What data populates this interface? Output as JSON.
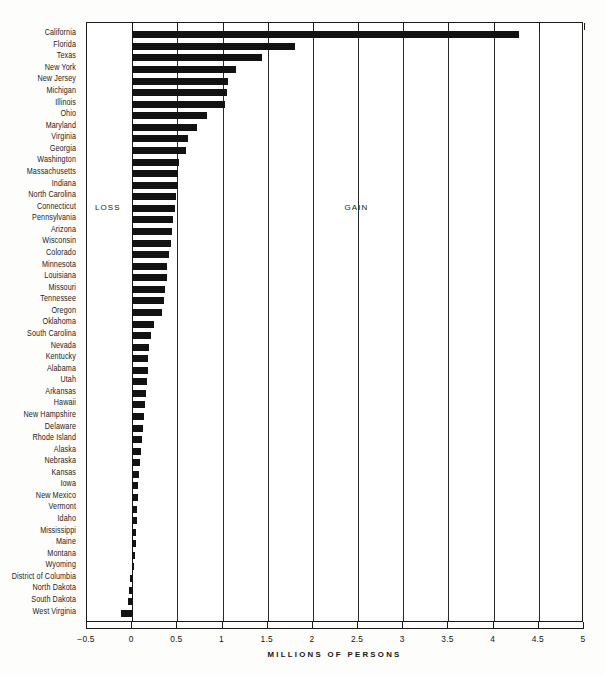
{
  "chart_data": {
    "type": "bar",
    "orientation": "horizontal",
    "title": "",
    "xlabel": "MILLIONS OF PERSONS",
    "ylabel": "",
    "xlim": [
      -0.5,
      5
    ],
    "xticks": [
      -0.5,
      0,
      0.5,
      1,
      1.5,
      2,
      2.5,
      3,
      3.5,
      4,
      4.5,
      5
    ],
    "xtick_labels": [
      "−0.5",
      "0",
      "0.5",
      "1",
      "1.5",
      "2",
      "2.5",
      "3",
      "3.5",
      "4",
      "4.5",
      "5"
    ],
    "grid": true,
    "grid_axis": "x",
    "zero_reference_line": 0,
    "legend": null,
    "annotations": [
      {
        "text": "LOSS",
        "x": -0.2,
        "y_category": "Connecticut"
      },
      {
        "text": "GAIN",
        "x": 2.35,
        "y_category": "Connecticut"
      }
    ],
    "categories": [
      "California",
      "Florida",
      "Texas",
      "New York",
      "New Jersey",
      "Michigan",
      "Illinois",
      "Ohio",
      "Maryland",
      "Virginia",
      "Georgia",
      "Washington",
      "Massachusetts",
      "Indiana",
      "North Carolina",
      "Connecticut",
      "Pennsylvania",
      "Arizona",
      "Wisconsin",
      "Colorado",
      "Minnesota",
      "Louisiana",
      "Missouri",
      "Tennessee",
      "Oregon",
      "Oklahoma",
      "South Carolina",
      "Nevada",
      "Kentucky",
      "Alabama",
      "Utah",
      "Arkansas",
      "Hawaii",
      "New Hampshire",
      "Delaware",
      "Rhode Island",
      "Alaska",
      "Nebraska",
      "Kansas",
      "Iowa",
      "New Mexico",
      "Vermont",
      "Idaho",
      "Mississippi",
      "Maine",
      "Montana",
      "Wyoming",
      "District of Columbia",
      "North Dakota",
      "South Dakota",
      "West Virginia"
    ],
    "values": [
      4.28,
      1.8,
      1.44,
      1.15,
      1.06,
      1.05,
      1.03,
      0.83,
      0.72,
      0.62,
      0.6,
      0.52,
      0.51,
      0.51,
      0.49,
      0.47,
      0.45,
      0.44,
      0.43,
      0.41,
      0.39,
      0.38,
      0.36,
      0.35,
      0.33,
      0.24,
      0.21,
      0.19,
      0.18,
      0.17,
      0.16,
      0.15,
      0.14,
      0.13,
      0.12,
      0.11,
      0.1,
      0.09,
      0.08,
      0.07,
      0.06,
      0.05,
      0.05,
      0.04,
      0.04,
      0.03,
      0.02,
      -0.02,
      -0.04,
      -0.05,
      -0.12
    ],
    "units": "millions of persons"
  }
}
